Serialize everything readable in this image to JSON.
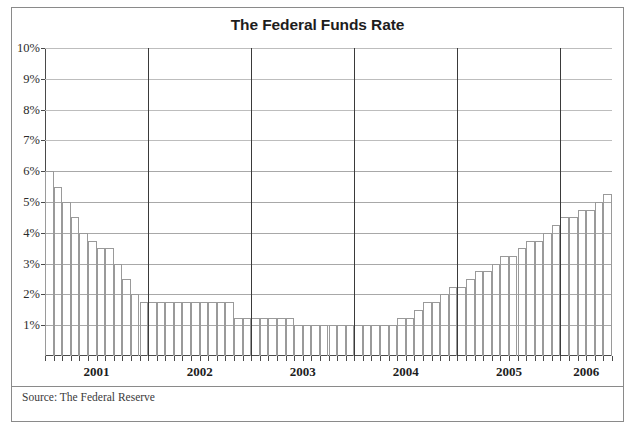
{
  "scan": {
    "top_partial_text": "·  ·   ·· ·   ·"
  },
  "figure": {
    "title": "The Federal Funds Rate",
    "source_note": "Source: The Federal Reserve",
    "frame_color": "#8a8a8a",
    "bar_outline_color": "#9a9a9a",
    "gridline_color": "#a8a8a8",
    "axis_color": "#4a4a4a",
    "year_separator_color": "#3a3a3a"
  },
  "chart_data": {
    "type": "bar",
    "title": "The Federal Funds Rate",
    "xlabel": "",
    "ylabel": "",
    "ylim": [
      0,
      10
    ],
    "ytick_values": [
      1,
      2,
      3,
      4,
      5,
      6,
      7,
      8,
      9,
      10
    ],
    "ytick_labels": [
      "1%",
      "2%",
      "3%",
      "4%",
      "5%",
      "6%",
      "7%",
      "8%",
      "9%",
      "10%"
    ],
    "grid": true,
    "legend": "none",
    "year_labels": [
      "2001",
      "2002",
      "2003",
      "2004",
      "2005",
      "2006"
    ],
    "year_boundaries": [
      "2001-12",
      "2002-12",
      "2003-12",
      "2004-12",
      "2005-12"
    ],
    "categories": [
      "2001-01",
      "2001-02",
      "2001-03",
      "2001-04",
      "2001-05",
      "2001-06",
      "2001-07",
      "2001-08",
      "2001-09",
      "2001-10",
      "2001-11",
      "2001-12",
      "2002-01",
      "2002-02",
      "2002-03",
      "2002-04",
      "2002-05",
      "2002-06",
      "2002-07",
      "2002-08",
      "2002-09",
      "2002-10",
      "2002-11",
      "2002-12",
      "2003-01",
      "2003-02",
      "2003-03",
      "2003-04",
      "2003-05",
      "2003-06",
      "2003-07",
      "2003-08",
      "2003-09",
      "2003-10",
      "2003-11",
      "2003-12",
      "2004-01",
      "2004-02",
      "2004-03",
      "2004-04",
      "2004-05",
      "2004-06",
      "2004-07",
      "2004-08",
      "2004-09",
      "2004-10",
      "2004-11",
      "2004-12",
      "2005-01",
      "2005-02",
      "2005-03",
      "2005-04",
      "2005-05",
      "2005-06",
      "2005-07",
      "2005-08",
      "2005-09",
      "2005-10",
      "2005-11",
      "2005-12",
      "2006-01",
      "2006-02",
      "2006-03",
      "2006-04",
      "2006-05",
      "2006-06"
    ],
    "values": [
      6.0,
      5.5,
      5.0,
      4.5,
      4.0,
      3.75,
      3.5,
      3.5,
      3.0,
      2.5,
      2.0,
      1.75,
      1.75,
      1.75,
      1.75,
      1.75,
      1.75,
      1.75,
      1.75,
      1.75,
      1.75,
      1.75,
      1.25,
      1.25,
      1.25,
      1.25,
      1.25,
      1.25,
      1.25,
      1.0,
      1.0,
      1.0,
      1.0,
      1.0,
      1.0,
      1.0,
      1.0,
      1.0,
      1.0,
      1.0,
      1.0,
      1.25,
      1.25,
      1.5,
      1.75,
      1.75,
      2.0,
      2.25,
      2.25,
      2.5,
      2.75,
      2.75,
      3.0,
      3.25,
      3.25,
      3.5,
      3.75,
      3.75,
      4.0,
      4.25,
      4.5,
      4.5,
      4.75,
      4.75,
      5.0,
      5.25
    ],
    "peak_start_value": 6.0,
    "trough_value": 1.0,
    "end_value": 5.25
  }
}
